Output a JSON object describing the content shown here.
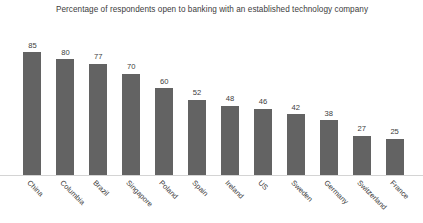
{
  "chart_data": {
    "type": "bar",
    "title": "Percentage of respondents open to banking with an established technology company",
    "xlabel": "",
    "ylabel": "",
    "ylim": [
      0,
      92
    ],
    "grid": false,
    "legend": null,
    "bar_color": "#636363",
    "axis_color": "#d4d4d4",
    "value_labels_shown": true,
    "xtick_rotation_deg": 45,
    "categories": [
      "China",
      "Columbia",
      "Brazil",
      "Singapore",
      "Poland",
      "Spain",
      "Ireland",
      "US",
      "Sweden",
      "Germany",
      "Switzerland",
      "France"
    ],
    "values": [
      85,
      80,
      77,
      70,
      60,
      52,
      48,
      46,
      42,
      38,
      27,
      25
    ]
  }
}
